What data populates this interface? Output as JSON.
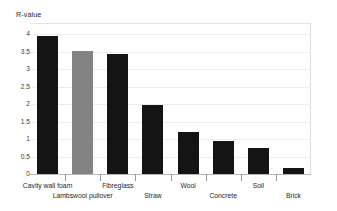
{
  "chart_data": {
    "type": "bar",
    "title": "",
    "subtitle": "",
    "xlabel": "",
    "ylabel": "R-value",
    "ylim": [
      0,
      4
    ],
    "grid": true,
    "legend": "none",
    "yticks": [
      "0",
      "0.5",
      "1",
      "1.5",
      "2",
      "2.5",
      "3",
      "3.5",
      "4"
    ],
    "ytick_values": [
      0,
      0.5,
      1,
      1.5,
      2,
      2.5,
      3,
      3.5,
      4
    ],
    "categories": [
      "Cavity wall foam",
      "Lambswool pullover",
      "Fibreglass",
      "Straw",
      "Wool",
      "Concrete",
      "Soil",
      "Brick"
    ],
    "values": [
      3.93,
      3.52,
      3.43,
      1.97,
      1.2,
      0.94,
      0.74,
      0.17
    ],
    "bar_colors": [
      "#141414",
      "#838383",
      "#141414",
      "#141414",
      "#141414",
      "#141414",
      "#141414",
      "#141414"
    ],
    "label_rows": [
      1,
      2,
      1,
      2,
      1,
      2,
      1,
      2
    ]
  },
  "axis": {
    "y_title": "R-value"
  },
  "colors": {
    "bar_primary": "#141414",
    "bar_highlight": "#838383",
    "gridline": "#ececec",
    "axis_line": "#b8b8b8",
    "text": "#231f20",
    "background": "#ffffff"
  }
}
